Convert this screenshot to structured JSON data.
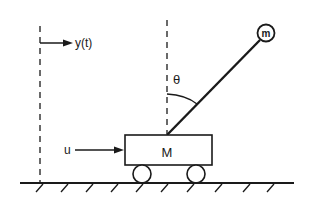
{
  "diagram": {
    "labels": {
      "displacement": "y(t)",
      "angle": "θ",
      "bob_mass": "m",
      "cart_mass": "M",
      "force": "u"
    },
    "colors": {
      "stroke": "#1a1a1a",
      "background": "#ffffff"
    }
  }
}
